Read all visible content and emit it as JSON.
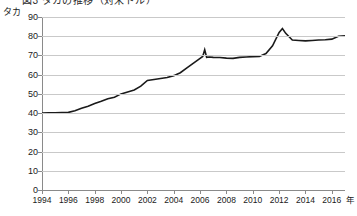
{
  "title": {
    "text": "図3 タカの推移（対米ドル）",
    "note": "clipped at top edge of screenshot"
  },
  "axis": {
    "y_unit": "タカ",
    "x_unit": "年",
    "y_ticks": [
      0,
      10,
      20,
      30,
      40,
      50,
      60,
      70,
      80,
      90
    ],
    "x_ticks": [
      1994,
      1996,
      1998,
      2000,
      2002,
      2004,
      2006,
      2008,
      2010,
      2012,
      2014,
      2016
    ]
  },
  "colors": {
    "line": "#1a1a1a",
    "grid": "#c9c9c9",
    "axis": "#8a8a8a",
    "text": "#1a1a1a",
    "background": "#ffffff"
  },
  "chart_data": {
    "type": "line",
    "title": "図3 タカの推移（対米ドル）",
    "xlabel": "年",
    "ylabel": "タカ",
    "xlim": [
      1994,
      2017
    ],
    "ylim": [
      0,
      90
    ],
    "grid": true,
    "legend": "none",
    "series": [
      {
        "name": "タカ／米ドル",
        "x": [
          1994.0,
          1994.5,
          1995.0,
          1995.5,
          1996.0,
          1996.5,
          1997.0,
          1997.5,
          1998.0,
          1998.5,
          1999.0,
          1999.5,
          2000.0,
          2000.5,
          2001.0,
          2001.5,
          2002.0,
          2002.5,
          2003.0,
          2003.5,
          2004.0,
          2004.5,
          2005.0,
          2005.5,
          2006.0,
          2006.2,
          2006.35,
          2006.5,
          2006.7,
          2007.0,
          2007.5,
          2008.0,
          2008.5,
          2009.0,
          2009.5,
          2010.0,
          2010.5,
          2011.0,
          2011.5,
          2012.0,
          2012.25,
          2012.5,
          2013.0,
          2013.5,
          2014.0,
          2014.5,
          2015.0,
          2015.5,
          2016.0,
          2016.5,
          2017.0
        ],
        "y": [
          40.0,
          40.1,
          40.2,
          40.3,
          40.4,
          41.2,
          42.5,
          43.6,
          45.0,
          46.2,
          47.5,
          48.3,
          50.0,
          51.0,
          52.0,
          54.0,
          57.0,
          57.5,
          58.0,
          58.5,
          59.5,
          61.0,
          63.5,
          66.0,
          68.5,
          69.5,
          73.0,
          69.0,
          69.2,
          69.0,
          68.9,
          68.6,
          68.5,
          69.0,
          69.2,
          69.4,
          69.5,
          71.0,
          75.0,
          82.0,
          84.0,
          81.5,
          78.0,
          77.8,
          77.6,
          77.8,
          78.0,
          78.2,
          78.5,
          80.0,
          80.2
        ],
        "color": "#1a1a1a"
      }
    ],
    "annotations": [
      {
        "text": "2006年の急騰スパイク",
        "x": 2006.35,
        "y": 73.0
      },
      {
        "text": "2012年のピーク",
        "x": 2012.25,
        "y": 84.0
      }
    ]
  }
}
